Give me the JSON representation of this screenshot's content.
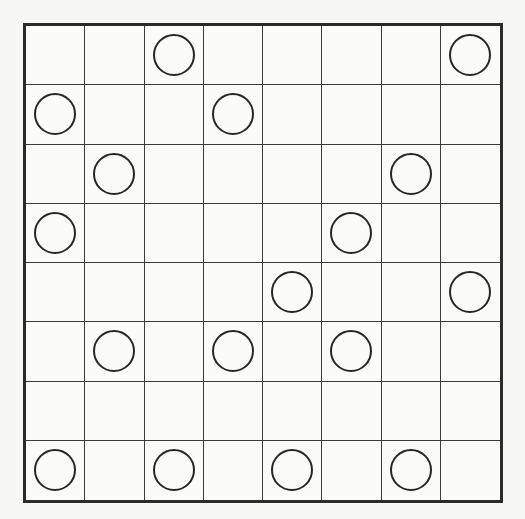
{
  "puzzle": {
    "title": "Grid Puzzle Board",
    "board_type": "8x8-circle-grid",
    "rows": 8,
    "columns": 8,
    "total_circles": 17,
    "colors": {
      "page_background": "#f7f7f6",
      "board_background": "#fbfbfa",
      "outer_border": "#2b2b2b",
      "grid_line": "#3a3a3a",
      "circle_stroke": "#262626",
      "circle_fill": "transparent"
    },
    "geometry": {
      "board_left": 23,
      "board_top": 23,
      "board_width": 480,
      "board_height": 480,
      "cell_size": 60,
      "outer_border_width": 3,
      "grid_line_width": 1,
      "circle_diameter": 42,
      "circle_stroke_width": 2
    },
    "grid": [
      [
        0,
        0,
        1,
        0,
        0,
        0,
        0,
        1
      ],
      [
        1,
        0,
        0,
        1,
        0,
        0,
        0,
        0
      ],
      [
        0,
        1,
        0,
        0,
        0,
        0,
        1,
        0
      ],
      [
        1,
        0,
        0,
        0,
        0,
        1,
        0,
        0
      ],
      [
        0,
        0,
        0,
        0,
        1,
        0,
        0,
        1
      ],
      [
        0,
        1,
        0,
        1,
        0,
        1,
        0,
        0
      ],
      [
        0,
        0,
        0,
        0,
        0,
        0,
        0,
        0
      ],
      [
        1,
        0,
        1,
        0,
        1,
        0,
        1,
        0
      ]
    ],
    "circle_positions": [
      {
        "row": 1,
        "col": 3
      },
      {
        "row": 1,
        "col": 8
      },
      {
        "row": 2,
        "col": 1
      },
      {
        "row": 2,
        "col": 4
      },
      {
        "row": 3,
        "col": 2
      },
      {
        "row": 3,
        "col": 7
      },
      {
        "row": 4,
        "col": 1
      },
      {
        "row": 4,
        "col": 6
      },
      {
        "row": 5,
        "col": 5
      },
      {
        "row": 5,
        "col": 8
      },
      {
        "row": 6,
        "col": 2
      },
      {
        "row": 6,
        "col": 4
      },
      {
        "row": 6,
        "col": 6
      },
      {
        "row": 8,
        "col": 1
      },
      {
        "row": 8,
        "col": 3
      },
      {
        "row": 8,
        "col": 5
      },
      {
        "row": 8,
        "col": 7
      }
    ],
    "row_counts": [
      2,
      2,
      2,
      2,
      2,
      3,
      0,
      4
    ],
    "column_counts": [
      3,
      2,
      2,
      2,
      2,
      2,
      2,
      2
    ]
  }
}
